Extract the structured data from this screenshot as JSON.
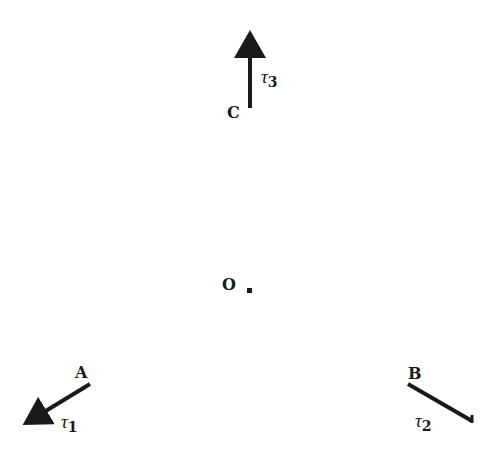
{
  "diagram": {
    "width": 496,
    "height": 466,
    "colors": {
      "ink": "#1a1a1a",
      "background": "#ffffff"
    },
    "points": [
      {
        "id": "O",
        "label": "O",
        "label_x": 222,
        "label_y": 290,
        "x": 250,
        "y": 291
      },
      {
        "id": "A",
        "label": "A",
        "label_x": 75,
        "label_y": 378
      },
      {
        "id": "B",
        "label": "B",
        "label_x": 408,
        "label_y": 379
      },
      {
        "id": "C",
        "label": "C",
        "label_x": 227,
        "label_y": 118
      }
    ],
    "vectors": [
      {
        "id": "tau1",
        "symbol": "τ",
        "subscript": "1",
        "from": [
          90,
          384
        ],
        "to": [
          20,
          427
        ],
        "label_x": 61,
        "label_y": 428,
        "arrowhead": true
      },
      {
        "id": "tau2",
        "symbol": "τ",
        "subscript": "2",
        "from": [
          408,
          384
        ],
        "to": [
          472,
          421
        ],
        "label_x": 415,
        "label_y": 427,
        "arrowhead": false
      },
      {
        "id": "tau3",
        "symbol": "τ",
        "subscript": "3",
        "from": [
          250,
          108
        ],
        "to": [
          250,
          27
        ],
        "label_x": 261,
        "label_y": 84,
        "arrowhead": true
      }
    ]
  }
}
